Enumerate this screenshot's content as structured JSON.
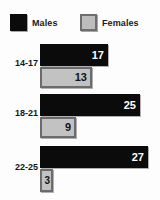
{
  "chart_data": {
    "type": "bar",
    "orientation": "horizontal",
    "title": "",
    "xlabel": "",
    "ylabel": "",
    "categories": [
      "14-17",
      "18-21",
      "22-25"
    ],
    "series": [
      {
        "name": "Males",
        "color": "#0b0b0b",
        "values": [
          17,
          25,
          27
        ]
      },
      {
        "name": "Females",
        "color": "#c2c2c2",
        "values": [
          13,
          9,
          3
        ]
      }
    ],
    "xlim": [
      0,
      30
    ],
    "grid": false,
    "legend_position": "top",
    "data_labels": true
  },
  "legend": {
    "males": {
      "label": "Males",
      "swatch": "black-square-swatch"
    },
    "females": {
      "label": "Females",
      "swatch": "gray-square-swatch"
    }
  },
  "groups": [
    {
      "label": "14-17",
      "male": {
        "value": "17",
        "width_px": 68
      },
      "female": {
        "value": "13",
        "width_px": 52
      }
    },
    {
      "label": "18-21",
      "male": {
        "value": "25",
        "width_px": 100
      },
      "female": {
        "value": "9",
        "width_px": 36
      }
    },
    {
      "label": "22-25",
      "male": {
        "value": "27",
        "width_px": 108
      },
      "female": {
        "value": "3",
        "width_px": 13
      }
    }
  ]
}
